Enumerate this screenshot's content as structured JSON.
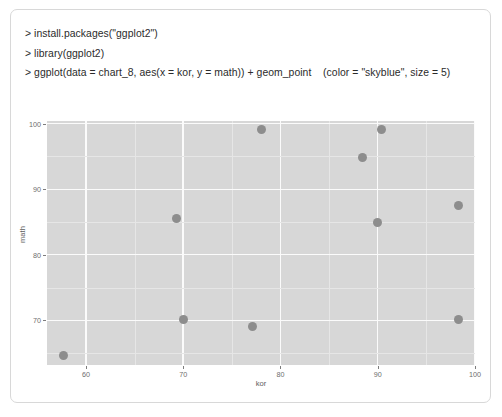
{
  "console": {
    "lines": [
      "> install.packages(\"ggplot2\")",
      "> library(ggplot2)",
      "> ggplot(data = chart_8, aes(x = kor, y = math)) + geom_point    (color = \"skyblue\", size = 5)"
    ],
    "line1": "> install.packages(\"ggplot2\")",
    "line2": "> library(ggplot2)",
    "line3": "> ggplot(data = chart_8, aes(x = kor, y = math)) + geom_point    (color = \"skyblue\", size = 5)"
  },
  "chart_data": {
    "type": "scatter",
    "title": "",
    "xlabel": "kor",
    "ylabel": "math",
    "xlim": [
      56.0,
      100.0
    ],
    "ylim": [
      63.2,
      100.4
    ],
    "xticks": [
      60,
      70,
      80,
      90,
      100
    ],
    "yticks": [
      70,
      80,
      90,
      100
    ],
    "xtick_labels": [
      "60",
      "70",
      "80",
      "90",
      "100"
    ],
    "ytick_labels": [
      "70",
      "80",
      "90",
      "100"
    ],
    "grid": true,
    "legend": "none",
    "panel_background": "#d7d7d7",
    "gridline_color": "#fbfbfb",
    "point_color": "#8d8d8d",
    "point_size": 5,
    "x": [
      57.7,
      69.3,
      70.0,
      77.1,
      78.0,
      88.4,
      90.0,
      90.4,
      98.3,
      98.3
    ],
    "y": [
      64.6,
      85.5,
      70.2,
      69.1,
      99.1,
      94.9,
      84.9,
      99.1,
      87.5,
      70.2
    ],
    "points": [
      {
        "kor": 57.7,
        "math": 64.6
      },
      {
        "kor": 69.3,
        "math": 85.5
      },
      {
        "kor": 70.0,
        "math": 70.2
      },
      {
        "kor": 77.1,
        "math": 69.1
      },
      {
        "kor": 78.0,
        "math": 99.1
      },
      {
        "kor": 88.4,
        "math": 94.9
      },
      {
        "kor": 90.0,
        "math": 84.9
      },
      {
        "kor": 90.4,
        "math": 99.1
      },
      {
        "kor": 98.3,
        "math": 87.5
      },
      {
        "kor": 98.3,
        "math": 70.2
      }
    ]
  }
}
